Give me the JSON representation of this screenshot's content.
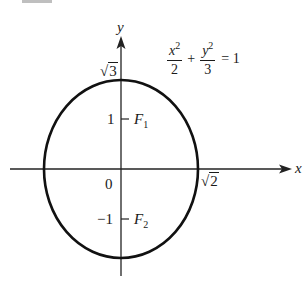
{
  "figure": {
    "cropped_number_fragment": "22.",
    "equation": {
      "term1_num": "x",
      "term1_num_exp": "2",
      "term1_den": "2",
      "plus": "+",
      "term2_num": "y",
      "term2_num_exp": "2",
      "term2_den": "3",
      "rhs": "= 1"
    },
    "axes": {
      "x_label": "x",
      "y_label": "y"
    },
    "labels": {
      "origin": "0",
      "y_tick_pos": "1",
      "y_tick_neg": "−1",
      "sqrt3_radicand": "3",
      "sqrt2_radicand": "2",
      "sqrt_symbol": "√",
      "focus1": "F",
      "focus1_sub": "1",
      "focus2": "F",
      "focus2_sub": "2"
    },
    "ellipse": {
      "semi_x": "√2",
      "semi_y": "√3",
      "foci": [
        "(0, 1)",
        "(0, -1)"
      ],
      "stroke_color": "#111111"
    }
  }
}
